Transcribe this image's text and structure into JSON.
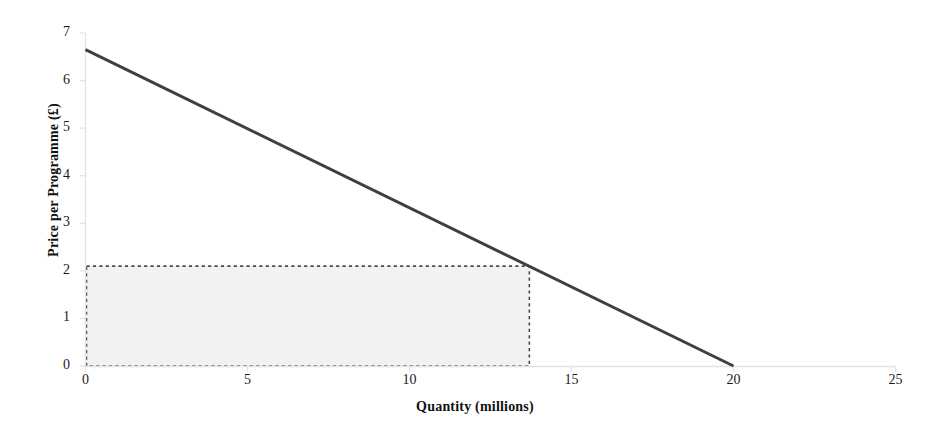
{
  "chart_data": {
    "type": "line",
    "title": "",
    "xlabel": "Quantity (millions)",
    "ylabel": "Price per Programme (£)",
    "xlim": [
      0,
      25
    ],
    "ylim": [
      0,
      7
    ],
    "x_ticks": [
      "0",
      "5",
      "10",
      "15",
      "20",
      "25"
    ],
    "x_tick_values": [
      0,
      5,
      10,
      15,
      20,
      25
    ],
    "y_ticks": [
      "0",
      "1",
      "2",
      "3",
      "4",
      "5",
      "6",
      "7"
    ],
    "y_tick_values": [
      0,
      1,
      2,
      3,
      4,
      5,
      6,
      7
    ],
    "grid": false,
    "legend": false,
    "series": [
      {
        "name": "Demand curve",
        "type": "line",
        "x": [
          0,
          20
        ],
        "values": [
          6.65,
          0
        ],
        "color": "#3f3f3f",
        "width": 3
      }
    ],
    "annotations": [
      {
        "name": "revenue-rectangle",
        "type": "rect",
        "x0": 0,
        "y0": 0,
        "x1": 13.7,
        "y1": 2.1,
        "fill": "#f2f2f2",
        "stroke": "#4a4a4a",
        "stroke_style": "dashed"
      }
    ],
    "axis_color": "#e3e3e3"
  },
  "colors": {
    "background": "#ffffff",
    "line": "#3f3f3f",
    "rect_fill": "#f2f2f2",
    "rect_stroke": "#4a4a4a",
    "axis": "#e3e3e3",
    "text": "#1a1a1a"
  }
}
